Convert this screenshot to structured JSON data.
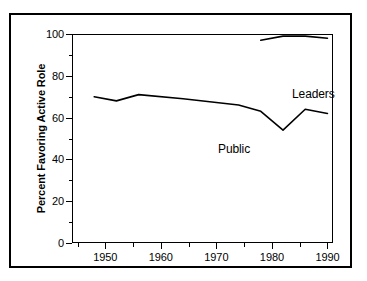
{
  "figure": {
    "frame_color": "#000000",
    "background": "#ffffff",
    "line_color": "#000000"
  },
  "chart_data": {
    "type": "line",
    "title": "",
    "xlabel": "",
    "ylabel": "Percent Favoring Active Role",
    "xlim": [
      1944,
      1991
    ],
    "ylim": [
      0,
      100
    ],
    "grid": false,
    "legend_position": "inline-annotations",
    "x_ticks_major": [
      1950,
      1960,
      1970,
      1980,
      1990
    ],
    "x_tick_labels": [
      "1950",
      "1960",
      "1970",
      "1980",
      "1990"
    ],
    "x_ticks_minor": [
      1945,
      1955,
      1965,
      1975,
      1985
    ],
    "y_ticks_major": [
      0,
      20,
      40,
      60,
      80,
      100
    ],
    "y_tick_labels": [
      "0",
      "20",
      "40",
      "60",
      "80",
      "100"
    ],
    "y_ticks_minor": [
      10,
      30,
      50,
      70,
      90
    ],
    "series": [
      {
        "name": "Public",
        "label": "Public",
        "x": [
          1948,
          1952,
          1956,
          1964,
          1974,
          1978,
          1982,
          1986,
          1990
        ],
        "values": [
          70,
          68,
          71,
          69,
          66,
          63,
          54,
          64,
          62
        ]
      },
      {
        "name": "Leaders",
        "label": "Leaders",
        "x": [
          1978,
          1982,
          1986,
          1990
        ],
        "values": [
          97,
          99,
          99,
          98
        ]
      }
    ]
  }
}
